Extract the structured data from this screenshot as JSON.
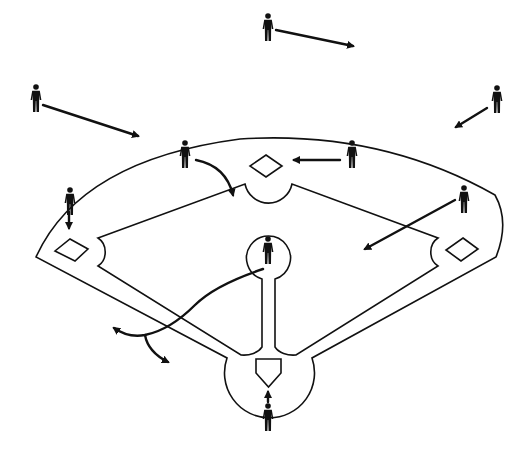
{
  "diagram": {
    "title": "",
    "colors": {
      "line": "#111111",
      "background": "#ffffff",
      "player": "#111111"
    },
    "field": {
      "outfield_arc": "grass-line arc from left foul line to right foul line",
      "bases": [
        "first-base",
        "second-base",
        "third-base",
        "home-plate"
      ],
      "pitchers_mound": "circle with basepath to home"
    },
    "players": [
      {
        "id": "left-fielder",
        "x": 36,
        "y": 97,
        "arrow": "toward left-center"
      },
      {
        "id": "center-fielder",
        "x": 268,
        "y": 27,
        "arrow": "toward right-center"
      },
      {
        "id": "right-fielder",
        "x": 497,
        "y": 98,
        "arrow": "toward shallow right"
      },
      {
        "id": "shortstop",
        "x": 185,
        "y": 152,
        "arrow": "curving toward second base"
      },
      {
        "id": "second-baseman",
        "x": 352,
        "y": 152,
        "arrow": "toward second base"
      },
      {
        "id": "third-baseman",
        "x": 70,
        "y": 199,
        "arrow": "toward third base"
      },
      {
        "id": "first-baseman",
        "x": 464,
        "y": 197,
        "arrow": "toward infield"
      },
      {
        "id": "pitcher",
        "x": 268,
        "y": 250,
        "arrow": "long curve toward third-base line"
      },
      {
        "id": "catcher",
        "x": 268,
        "y": 416,
        "arrow": "toward home plate"
      }
    ],
    "labels": []
  }
}
